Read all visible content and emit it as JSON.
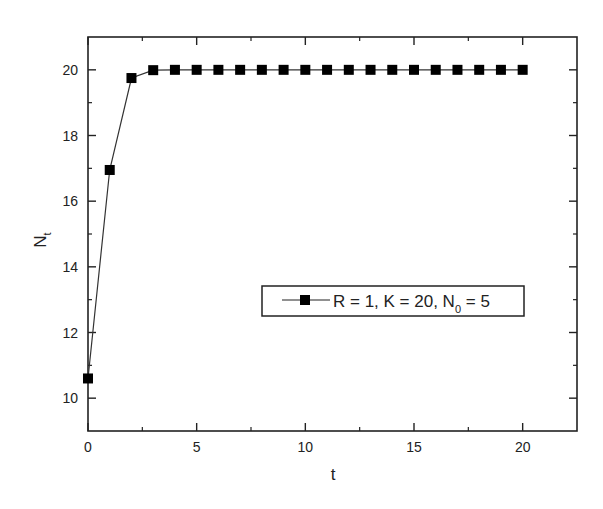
{
  "chart_data": {
    "type": "line",
    "title": "",
    "xlabel": "t",
    "ylabel": "N",
    "ylabel_subscript": "t",
    "xlim": [
      0,
      22.5
    ],
    "ylim": [
      9,
      21
    ],
    "x_ticks": [
      0,
      5,
      10,
      15,
      20
    ],
    "x_minor_ticks": [
      2.5,
      7.5,
      12.5,
      17.5
    ],
    "y_ticks": [
      10,
      12,
      14,
      16,
      18,
      20
    ],
    "y_minor_ticks": [
      11,
      13,
      15,
      17,
      19
    ],
    "grid": false,
    "legend_position": "center-right",
    "series": [
      {
        "name": "R = 1, K = 20, N0 = 5",
        "label_parts": {
          "main": "R = 1, K = 20, N",
          "sub": "0",
          "tail": " = 5"
        },
        "marker": "square",
        "color": "#000000",
        "x": [
          0,
          1,
          2,
          3,
          4,
          5,
          6,
          7,
          8,
          9,
          10,
          11,
          12,
          13,
          14,
          15,
          16,
          17,
          18,
          19,
          20
        ],
        "values": [
          10.6,
          16.95,
          19.75,
          19.99,
          20,
          20,
          20,
          20,
          20,
          20,
          20,
          20,
          20,
          20,
          20,
          20,
          20,
          20,
          20,
          20,
          20
        ]
      }
    ]
  }
}
